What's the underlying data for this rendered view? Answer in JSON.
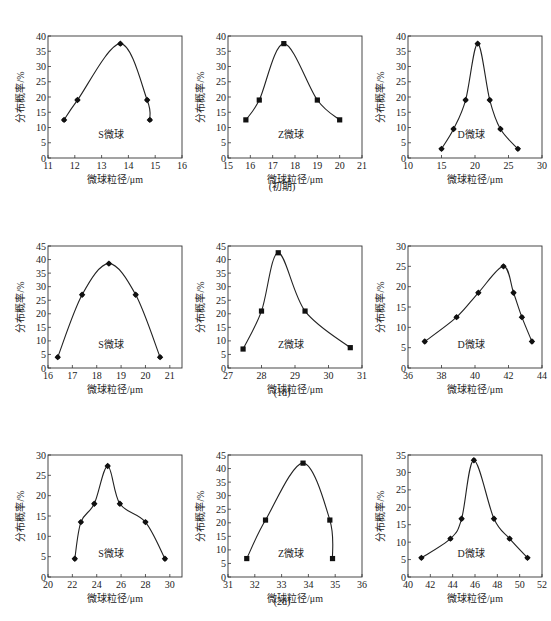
{
  "figure": {
    "row_captions": [
      "(初期)",
      "(1d)",
      "(2d)"
    ]
  },
  "chart_data": [
    {
      "type": "line",
      "row": 0,
      "col": 0,
      "marker": "diamond",
      "label": "S微球",
      "xlabel": "微球粒径/μm",
      "ylabel": "分布概率/%",
      "xlim": [
        11,
        16
      ],
      "ylim": [
        0,
        40
      ],
      "xticks": [
        11,
        12,
        13,
        14,
        15,
        16
      ],
      "yticks": [
        0,
        5,
        10,
        15,
        20,
        25,
        30,
        35,
        40
      ],
      "x": [
        11.6,
        12.1,
        13.7,
        14.7,
        14.8
      ],
      "y": [
        12.5,
        19,
        37.5,
        19,
        12.5
      ]
    },
    {
      "type": "line",
      "row": 0,
      "col": 1,
      "marker": "square",
      "label": "Z微球",
      "xlabel": "微球粒径/μm",
      "ylabel": "分布概率/%",
      "xlim": [
        15,
        21
      ],
      "ylim": [
        0,
        40
      ],
      "xticks": [
        15,
        16,
        17,
        18,
        19,
        20,
        21
      ],
      "yticks": [
        0,
        5,
        10,
        15,
        20,
        25,
        30,
        35,
        40
      ],
      "x": [
        15.8,
        16.4,
        17.5,
        19.0,
        20.0
      ],
      "y": [
        12.5,
        19,
        37.5,
        19,
        12.5
      ]
    },
    {
      "type": "line",
      "row": 0,
      "col": 2,
      "marker": "diamond",
      "label": "D微球",
      "xlabel": "微球粒径/μm",
      "ylabel": "分布概率/%",
      "xlim": [
        10,
        30
      ],
      "ylim": [
        0,
        40
      ],
      "xticks": [
        10,
        15,
        20,
        25,
        30
      ],
      "yticks": [
        0,
        5,
        10,
        15,
        20,
        25,
        30,
        35,
        40
      ],
      "x": [
        15.0,
        16.8,
        18.6,
        20.4,
        22.2,
        23.8,
        26.4
      ],
      "y": [
        3,
        9.5,
        19,
        37.5,
        19,
        9.5,
        3
      ]
    },
    {
      "type": "line",
      "row": 1,
      "col": 0,
      "marker": "diamond",
      "label": "S微球",
      "xlabel": "微球粒径/μm",
      "ylabel": "分布概率/%",
      "xlim": [
        16,
        21.5
      ],
      "ylim": [
        0,
        45
      ],
      "xticks": [
        16,
        17,
        18,
        19,
        20,
        21
      ],
      "yticks": [
        0,
        5,
        10,
        15,
        20,
        25,
        30,
        35,
        40,
        45
      ],
      "x": [
        16.4,
        17.4,
        18.5,
        19.6,
        20.6
      ],
      "y": [
        4,
        27,
        38.5,
        27,
        4
      ]
    },
    {
      "type": "line",
      "row": 1,
      "col": 1,
      "marker": "square",
      "label": "Z微球",
      "xlabel": "微球粒径/μm",
      "ylabel": "分布概率/%",
      "xlim": [
        27,
        31
      ],
      "ylim": [
        0,
        45
      ],
      "xticks": [
        27,
        28,
        29,
        30,
        31
      ],
      "yticks": [
        0,
        5,
        10,
        15,
        20,
        25,
        30,
        35,
        40,
        45
      ],
      "x": [
        27.45,
        28.0,
        28.5,
        29.3,
        30.65
      ],
      "y": [
        7,
        21,
        42.5,
        21,
        7.5
      ]
    },
    {
      "type": "line",
      "row": 1,
      "col": 2,
      "marker": "diamond",
      "label": "D微球",
      "xlabel": "微球粒径/μm",
      "ylabel": "分布概率/%",
      "xlim": [
        36,
        44
      ],
      "ylim": [
        0,
        30
      ],
      "xticks": [
        36,
        38,
        40,
        42,
        44
      ],
      "yticks": [
        0,
        5,
        10,
        15,
        20,
        25,
        30
      ],
      "x": [
        37.0,
        38.9,
        40.2,
        41.7,
        42.3,
        42.8,
        43.4
      ],
      "y": [
        6.5,
        12.5,
        18.5,
        25,
        18.5,
        12.5,
        6.5
      ]
    },
    {
      "type": "line",
      "row": 2,
      "col": 0,
      "marker": "diamond",
      "label": "S微球",
      "xlabel": "微球粒径/μm",
      "ylabel": "分布概率/%",
      "xlim": [
        20,
        31
      ],
      "ylim": [
        0,
        30
      ],
      "xticks": [
        20,
        22,
        24,
        26,
        28,
        30
      ],
      "yticks": [
        0,
        5,
        10,
        15,
        20,
        25,
        30
      ],
      "x": [
        22.2,
        22.7,
        23.8,
        24.9,
        25.9,
        28.0,
        29.6
      ],
      "y": [
        4.5,
        13.5,
        18,
        27.3,
        18,
        13.5,
        4.5
      ]
    },
    {
      "type": "line",
      "row": 2,
      "col": 1,
      "marker": "square",
      "label": "Z微球",
      "xlabel": "微球粒径/μm",
      "ylabel": "分布概率/%",
      "xlim": [
        31,
        36
      ],
      "ylim": [
        0,
        45
      ],
      "xticks": [
        31,
        32,
        33,
        34,
        35,
        36
      ],
      "yticks": [
        0,
        5,
        10,
        15,
        20,
        25,
        30,
        35,
        40,
        45
      ],
      "x": [
        31.7,
        32.4,
        33.8,
        34.8,
        34.9
      ],
      "y": [
        6.8,
        21,
        42,
        21,
        6.8
      ]
    },
    {
      "type": "line",
      "row": 2,
      "col": 2,
      "marker": "diamond",
      "label": "D微球",
      "xlabel": "微球粒径/μm",
      "ylabel": "分布概率/%",
      "xlim": [
        40,
        52
      ],
      "ylim": [
        0,
        35
      ],
      "xticks": [
        40,
        42,
        44,
        46,
        48,
        50,
        52
      ],
      "yticks": [
        0,
        5,
        10,
        15,
        20,
        25,
        30,
        35
      ],
      "x": [
        41.2,
        43.8,
        44.8,
        45.9,
        47.7,
        49.1,
        50.7
      ],
      "y": [
        5.5,
        11,
        16.7,
        33.5,
        16.7,
        11,
        5.5
      ]
    }
  ]
}
